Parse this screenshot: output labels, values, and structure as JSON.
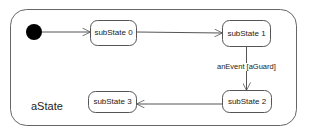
{
  "diagram": {
    "type": "uml-state-machine",
    "composite_state": {
      "name": "aState",
      "bounds": {
        "x": 10,
        "y": 9,
        "w": 287,
        "h": 117,
        "r": 16
      }
    },
    "initial_pseudostate": {
      "cx": 34,
      "cy": 32,
      "r": 8
    },
    "states": [
      {
        "id": "s0",
        "name": "subState 0",
        "x": 90,
        "y": 20,
        "w": 47,
        "h": 26
      },
      {
        "id": "s1",
        "name": "subState 1",
        "x": 222,
        "y": 20,
        "w": 49,
        "h": 27
      },
      {
        "id": "s2",
        "name": "subState 2",
        "x": 222,
        "y": 90,
        "w": 50,
        "h": 23
      },
      {
        "id": "s3",
        "name": "subState 3",
        "x": 88,
        "y": 91,
        "w": 49,
        "h": 22
      }
    ],
    "transitions": [
      {
        "from": "initial",
        "to": "s0",
        "label": ""
      },
      {
        "from": "s0",
        "to": "s1",
        "label": ""
      },
      {
        "from": "s1",
        "to": "s2",
        "label": "anEvent [aGuard]"
      },
      {
        "from": "s2",
        "to": "s3",
        "label": ""
      }
    ],
    "colors": {
      "stroke": "#555555",
      "fill": "#ffffff",
      "initial_fill": "#000000",
      "text": "#222222"
    }
  }
}
